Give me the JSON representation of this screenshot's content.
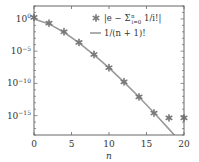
{
  "chart_data": {
    "type": "line",
    "title": "",
    "xlabel": "n",
    "ylabel": "",
    "yscale": "log",
    "xlim": [
      0,
      20
    ],
    "ylim_log10": [
      -18,
      2
    ],
    "grid": false,
    "legend_position": "upper right",
    "x_ticks": [
      0,
      5,
      10,
      15,
      20
    ],
    "x_tick_labels": [
      "0",
      "5",
      "10",
      "15",
      "20"
    ],
    "y_ticks_log10": [
      0,
      -5,
      -10,
      -15
    ],
    "y_tick_labels": [
      "10^0",
      "10^-5",
      "10^-10",
      "10^-15"
    ],
    "series": [
      {
        "name": "|e − Σ_{i=0}^{n} 1/i!|",
        "style": "markers",
        "marker": "asterisk",
        "color": "#7a7a7a",
        "x": [
          0,
          2,
          4,
          6,
          8,
          10,
          12,
          14,
          16,
          18,
          20
        ],
        "log10_y": [
          0.235,
          -0.661,
          -2.002,
          -3.645,
          -5.514,
          -7.563,
          -9.762,
          -12.09,
          -14.6,
          -15.35,
          -15.35
        ]
      },
      {
        "name": "1/(n+1)!",
        "style": "line",
        "color": "#9a9a9a",
        "x": [
          0,
          2,
          4,
          6,
          8,
          10,
          12,
          14,
          16,
          18,
          20
        ],
        "log10_y": [
          0,
          -0.778,
          -2.079,
          -3.702,
          -5.56,
          -7.601,
          -9.794,
          -12.116,
          -14.551,
          -17.085,
          -19.707
        ]
      }
    ]
  },
  "labels": {
    "x_axis": "n",
    "legend_series_1": "|e − Σ",
    "legend_series_1_sup": "n",
    "legend_series_1_sub": "i=0",
    "legend_series_1_tail": " 1/i!|",
    "legend_series_2": "1/(n + 1)!"
  }
}
